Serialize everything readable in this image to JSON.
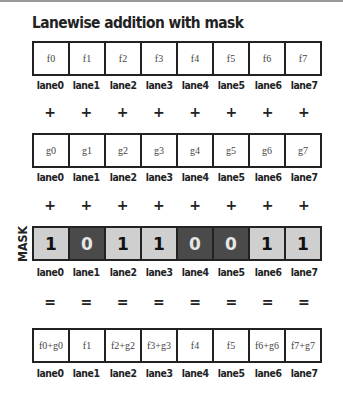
{
  "title": "Lanewise addition with mask",
  "lanes": [
    "lane0",
    "lane1",
    "lane2",
    "lane3",
    "lane4",
    "lane5",
    "lane6",
    "lane7"
  ],
  "row_f": [
    "f0",
    "f1",
    "f2",
    "f3",
    "f4",
    "f5",
    "f6",
    "f7"
  ],
  "row_g": [
    "g0",
    "g1",
    "g2",
    "g3",
    "g4",
    "g5",
    "g6",
    "g7"
  ],
  "mask_label": "MASK",
  "mask": [
    "1",
    "0",
    "1",
    "1",
    "0",
    "0",
    "1",
    "1"
  ],
  "result": [
    "f0+g0",
    "f1",
    "f2+g2",
    "f3+g3",
    "f4",
    "f5",
    "f6+g6",
    "f7+g7"
  ],
  "plus": "+",
  "equals": "=",
  "colors": {
    "mask_on": "#cfcfcf",
    "mask_off": "#4a4a4a",
    "border": "#222222"
  }
}
